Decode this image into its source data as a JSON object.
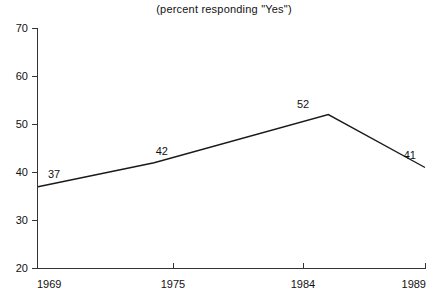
{
  "chart_data": {
    "type": "line",
    "title": "(percent responding \"Yes\")",
    "xlabel": "",
    "ylabel": "",
    "categories": [
      "1969",
      "1975",
      "1984",
      "1989"
    ],
    "x": [
      1969,
      1975,
      1984,
      1989
    ],
    "values": [
      37,
      42,
      52,
      41
    ],
    "point_labels": [
      "37",
      "42",
      "52",
      "41"
    ],
    "ylim": [
      20,
      70
    ],
    "yticks": [
      20,
      30,
      40,
      50,
      60,
      70
    ],
    "ytick_labels": [
      "20",
      "30",
      "40",
      "50",
      "60",
      "70"
    ],
    "xticks": [
      1969,
      1975,
      1984,
      1989
    ],
    "xtick_labels": [
      "1969",
      "1975",
      "1984",
      "1989"
    ],
    "grid": false,
    "legend": null,
    "line_color": "#1a1a1a",
    "axis_color": "#333333",
    "background_color": "#ffffff"
  }
}
